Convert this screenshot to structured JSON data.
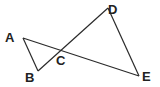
{
  "diagram": {
    "type": "geometry-figure",
    "points": [
      {
        "id": "A",
        "label": "A",
        "x": 23,
        "y": 38,
        "label_x": 5,
        "label_y": 42
      },
      {
        "id": "B",
        "label": "B",
        "x": 38,
        "y": 71,
        "label_x": 25,
        "label_y": 82
      },
      {
        "id": "C",
        "label": "C",
        "x": 62,
        "y": 51,
        "label_x": 56,
        "label_y": 65
      },
      {
        "id": "D",
        "label": "D",
        "x": 108,
        "y": 8,
        "label_x": 108,
        "label_y": 14
      },
      {
        "id": "E",
        "label": "E",
        "x": 139,
        "y": 76,
        "label_x": 142,
        "label_y": 81
      }
    ],
    "segments": [
      {
        "from": "A",
        "to": "E"
      },
      {
        "from": "B",
        "to": "D"
      },
      {
        "from": "A",
        "to": "B"
      },
      {
        "from": "D",
        "to": "E"
      }
    ],
    "colors": {
      "line": "#2a2a2a",
      "label": "#222222",
      "background": "#ffffff"
    }
  }
}
